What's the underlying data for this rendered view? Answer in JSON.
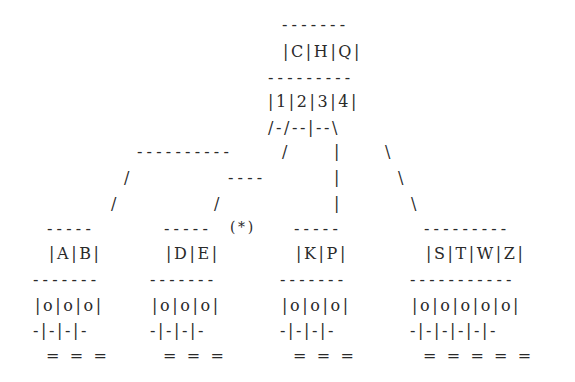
{
  "diagram": {
    "type": "b-tree",
    "root": {
      "top_border": "-------",
      "keys_row": "|C|H|Q|",
      "mid_border": "---------",
      "pointers_row": "|1|2|3|4|",
      "branch_row": "/-/--|--\\"
    },
    "connectors": {
      "row1_left_dashes": "----------",
      "row1_slash": "/",
      "row1_pipe": "|",
      "row1_backslash": "\\",
      "row2_slash": "/",
      "row2_dashes": "----",
      "row2_pipe": "|",
      "row2_backslash": "\\",
      "row3_slash_a": "/",
      "row3_slash_b": "/",
      "row3_pipe": "|",
      "row3_backslash": "\\"
    },
    "leaves": [
      {
        "top_border": "-----",
        "marker": "",
        "keys_row": "|A|B|",
        "mid_border": "-------",
        "slots_row": "|o|o|o|",
        "ptr_row": "-|-|-|-",
        "eq_row": "= = ="
      },
      {
        "top_border": "-----",
        "marker": "(*)",
        "keys_row": "|D|E|",
        "mid_border": "-------",
        "slots_row": "|o|o|o|",
        "ptr_row": "-|-|-|-",
        "eq_row": "= = ="
      },
      {
        "top_border": "-----",
        "marker": "",
        "keys_row": "|K|P|",
        "mid_border": "-------",
        "slots_row": "|o|o|o|",
        "ptr_row": "-|-|-|-",
        "eq_row": "= = ="
      },
      {
        "top_border": "---------",
        "marker": "",
        "keys_row": "|S|T|W|Z|",
        "mid_border": "-----------",
        "slots_row": "|o|o|o|o|o|",
        "ptr_row": "-|-|-|-|-|-",
        "eq_row": "= = = = ="
      }
    ]
  }
}
